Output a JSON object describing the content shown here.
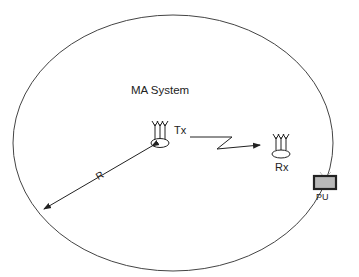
{
  "diagram": {
    "system_label": "MA System",
    "tx_label": "Tx",
    "rx_label": "Rx",
    "pu_label": "PU",
    "radius_label": "R",
    "colors": {
      "line": "#333333",
      "pu_screen": "#b8b8b8",
      "pu_frame": "#222222"
    }
  }
}
